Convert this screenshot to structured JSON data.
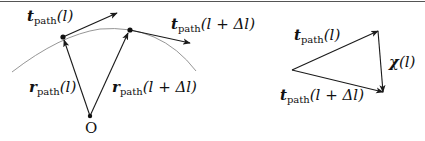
{
  "figure": {
    "stroke_color": "#1a1a1a",
    "curve_color": "#8a8a8a",
    "labels": {
      "t_l": {
        "sym": "t",
        "sub": "path",
        "arg": "(l)"
      },
      "t_ldl": {
        "sym": "t",
        "sub": "path",
        "arg": "(l + Δl)"
      },
      "r_l": {
        "sym": "r",
        "sub": "path",
        "arg": "(l)"
      },
      "r_ldl": {
        "sym": "r",
        "sub": "path",
        "arg": "(l + Δl)"
      },
      "origin": "O",
      "tri_t_l": {
        "sym": "t",
        "sub": "path",
        "arg": "(l)"
      },
      "tri_t_ldl": {
        "sym": "t",
        "sub": "path",
        "arg": "(l + Δl)"
      },
      "chi": {
        "sym": "χ",
        "arg": "(l)"
      }
    }
  }
}
